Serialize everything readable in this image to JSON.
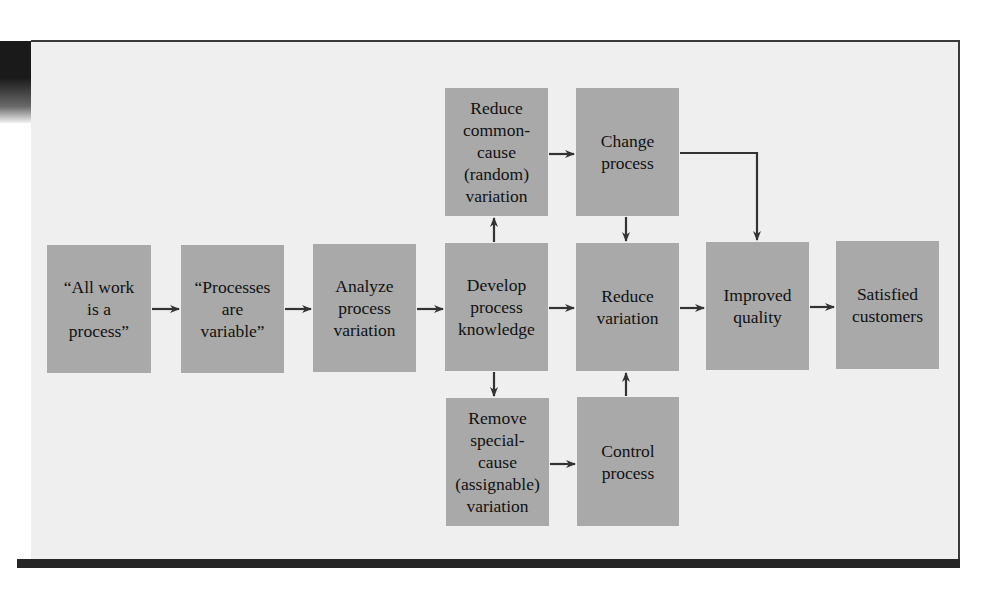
{
  "diagram": {
    "colors": {
      "background": "#efefef",
      "box_fill": "#a9a9a9",
      "arrow": "#333333",
      "frame_border": "#3a3a3a",
      "bottom_bar": "#262626"
    },
    "nodes": [
      {
        "id": "all-work",
        "label": "“All work\nis a\nprocess”"
      },
      {
        "id": "processes-variable",
        "label": "“Processes\nare\nvariable”"
      },
      {
        "id": "analyze",
        "label": "Analyze\nprocess\nvariation"
      },
      {
        "id": "develop",
        "label": "Develop\nprocess\nknowledge"
      },
      {
        "id": "reduce-common",
        "label": "Reduce\ncommon-\ncause\n(random)\nvariation"
      },
      {
        "id": "remove-special",
        "label": "Remove\nspecial-\ncause\n(assignable)\nvariation"
      },
      {
        "id": "change-process",
        "label": "Change\nprocess"
      },
      {
        "id": "reduce-variation",
        "label": "Reduce\nvariation"
      },
      {
        "id": "control-process",
        "label": "Control\nprocess"
      },
      {
        "id": "improved-quality",
        "label": "Improved\nquality"
      },
      {
        "id": "satisfied-customers",
        "label": "Satisfied\ncustomers"
      }
    ],
    "edges": [
      {
        "from": "all-work",
        "to": "processes-variable"
      },
      {
        "from": "processes-variable",
        "to": "analyze"
      },
      {
        "from": "analyze",
        "to": "develop"
      },
      {
        "from": "develop",
        "to": "reduce-common"
      },
      {
        "from": "develop",
        "to": "remove-special"
      },
      {
        "from": "develop",
        "to": "reduce-variation"
      },
      {
        "from": "reduce-common",
        "to": "change-process"
      },
      {
        "from": "remove-special",
        "to": "control-process"
      },
      {
        "from": "change-process",
        "to": "reduce-variation"
      },
      {
        "from": "control-process",
        "to": "reduce-variation"
      },
      {
        "from": "change-process",
        "to": "improved-quality"
      },
      {
        "from": "reduce-variation",
        "to": "improved-quality"
      },
      {
        "from": "improved-quality",
        "to": "satisfied-customers"
      }
    ]
  }
}
